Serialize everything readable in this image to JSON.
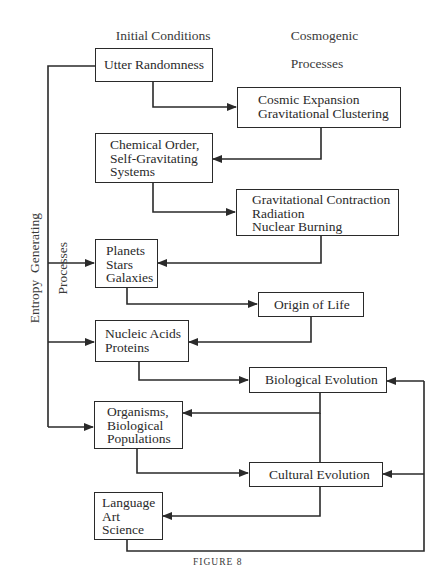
{
  "headers": {
    "left": [
      "Initial Conditions",
      "& Structures"
    ],
    "right": [
      "Cosmogenic",
      "Processes"
    ]
  },
  "side_label": [
    "Entropy  Generating",
    "Processes"
  ],
  "structures": [
    {
      "id": "utter-randomness",
      "lines": [
        "Utter Randomness"
      ]
    },
    {
      "id": "chemical-order",
      "lines": [
        "Chemical Order,",
        "Self-Gravitating",
        "Systems"
      ]
    },
    {
      "id": "planets-stars-galaxies",
      "lines": [
        "Planets",
        "Stars",
        "Galaxies"
      ]
    },
    {
      "id": "nucleic-acids-proteins",
      "lines": [
        "Nucleic Acids",
        "Proteins"
      ]
    },
    {
      "id": "organisms-populations",
      "lines": [
        "Organisms,",
        "Biological",
        "Populations"
      ]
    },
    {
      "id": "language-art-science",
      "lines": [
        "Language",
        "Art",
        "Science"
      ]
    }
  ],
  "processes": [
    {
      "id": "cosmic-expansion",
      "lines": [
        "Cosmic Expansion",
        "Gravitational Clustering"
      ]
    },
    {
      "id": "gravitational-contraction",
      "lines": [
        "Gravitational Contraction",
        "Radiation",
        "Nuclear Burning"
      ]
    },
    {
      "id": "origin-of-life",
      "lines": [
        "Origin of Life"
      ]
    },
    {
      "id": "biological-evolution",
      "lines": [
        "Biological Evolution"
      ]
    },
    {
      "id": "cultural-evolution",
      "lines": [
        "Cultural Evolution"
      ]
    }
  ],
  "edges": [
    [
      "utter-randomness",
      "cosmic-expansion"
    ],
    [
      "cosmic-expansion",
      "chemical-order"
    ],
    [
      "chemical-order",
      "gravitational-contraction"
    ],
    [
      "gravitational-contraction",
      "planets-stars-galaxies"
    ],
    [
      "planets-stars-galaxies",
      "origin-of-life"
    ],
    [
      "origin-of-life",
      "nucleic-acids-proteins"
    ],
    [
      "nucleic-acids-proteins",
      "biological-evolution"
    ],
    [
      "biological-evolution",
      "organisms-populations"
    ],
    [
      "biological-evolution",
      "cultural-evolution"
    ],
    [
      "organisms-populations",
      "cultural-evolution"
    ],
    [
      "cultural-evolution",
      "language-art-science"
    ],
    [
      "language-art-science",
      "biological-evolution"
    ],
    [
      "language-art-science",
      "cultural-evolution"
    ],
    [
      "entropy-generating-processes",
      "planets-stars-galaxies"
    ],
    [
      "entropy-generating-processes",
      "nucleic-acids-proteins"
    ],
    [
      "entropy-generating-processes",
      "organisms-populations"
    ],
    [
      "utter-randomness",
      "entropy-generating-processes"
    ]
  ],
  "caption": "FIGURE 8"
}
